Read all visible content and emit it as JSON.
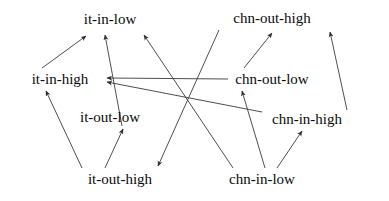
{
  "diagram": {
    "type": "directed-graph",
    "title": "",
    "background_color": "#ffffff",
    "edge_color": "#3a3a3a",
    "text_color": "#0a0a0a",
    "nodes": [
      {
        "id": "it-in-low",
        "label": "it-in-low",
        "x": 110,
        "y": 19
      },
      {
        "id": "chn-out-high",
        "label": "chn-out-high",
        "x": 272,
        "y": 18
      },
      {
        "id": "it-in-high",
        "label": "it-in-high",
        "x": 60,
        "y": 79
      },
      {
        "id": "chn-out-low",
        "label": "chn-out-low",
        "x": 272,
        "y": 79
      },
      {
        "id": "it-out-low",
        "label": "it-out-low",
        "x": 110,
        "y": 117
      },
      {
        "id": "chn-in-high",
        "label": "chn-in-high",
        "x": 307,
        "y": 119
      },
      {
        "id": "it-out-high",
        "label": "it-out-high",
        "x": 120,
        "y": 179
      },
      {
        "id": "chn-in-low",
        "label": "chn-in-low",
        "x": 262,
        "y": 179
      }
    ],
    "edges": [
      {
        "from": "it-in-high",
        "to": "it-in-low",
        "x1": 42,
        "y1": 68,
        "x2": 86,
        "y2": 36
      },
      {
        "from": "it-out-high",
        "to": "it-in-high",
        "x1": 82,
        "y1": 168,
        "x2": 46,
        "y2": 91
      },
      {
        "from": "it-out-high",
        "to": "it-out-low",
        "x1": 105,
        "y1": 168,
        "x2": 123,
        "y2": 129
      },
      {
        "from": "it-out-low",
        "to": "it-in-low",
        "x1": 122,
        "y1": 126,
        "x2": 105,
        "y2": 35
      },
      {
        "from": "chn-in-low",
        "to": "it-in-low",
        "x1": 233,
        "y1": 168,
        "x2": 144,
        "y2": 35
      },
      {
        "from": "chn-out-low",
        "to": "it-in-high",
        "x1": 228,
        "y1": 79,
        "x2": 107,
        "y2": 78
      },
      {
        "from": "chn-in-high",
        "to": "it-in-high",
        "x1": 262,
        "y1": 112,
        "x2": 107,
        "y2": 82
      },
      {
        "from": "chn-out-high",
        "to": "it-out-high",
        "x1": 219,
        "y1": 30,
        "x2": 158,
        "y2": 166
      },
      {
        "from": "chn-out-low",
        "to": "chn-out-high",
        "x1": 244,
        "y1": 68,
        "x2": 272,
        "y2": 33
      },
      {
        "from": "chn-in-high",
        "to": "chn-out-high",
        "x1": 347,
        "y1": 110,
        "x2": 330,
        "y2": 32
      },
      {
        "from": "chn-in-low",
        "to": "chn-out-low",
        "x1": 265,
        "y1": 168,
        "x2": 242,
        "y2": 91
      },
      {
        "from": "chn-in-low",
        "to": "chn-in-high",
        "x1": 277,
        "y1": 168,
        "x2": 302,
        "y2": 131
      }
    ]
  }
}
